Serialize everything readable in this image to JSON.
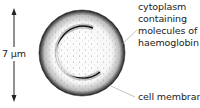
{
  "diagram": {
    "labels": {
      "cytoplasm": [
        "cytoplasm",
        "containing",
        "molecules of",
        "haemoglobin"
      ],
      "membrane": "cell membrane",
      "dimension": "7 µm"
    },
    "colors": {
      "ink": "#222222",
      "leader": "#999999",
      "background": "#ffffff"
    }
  }
}
